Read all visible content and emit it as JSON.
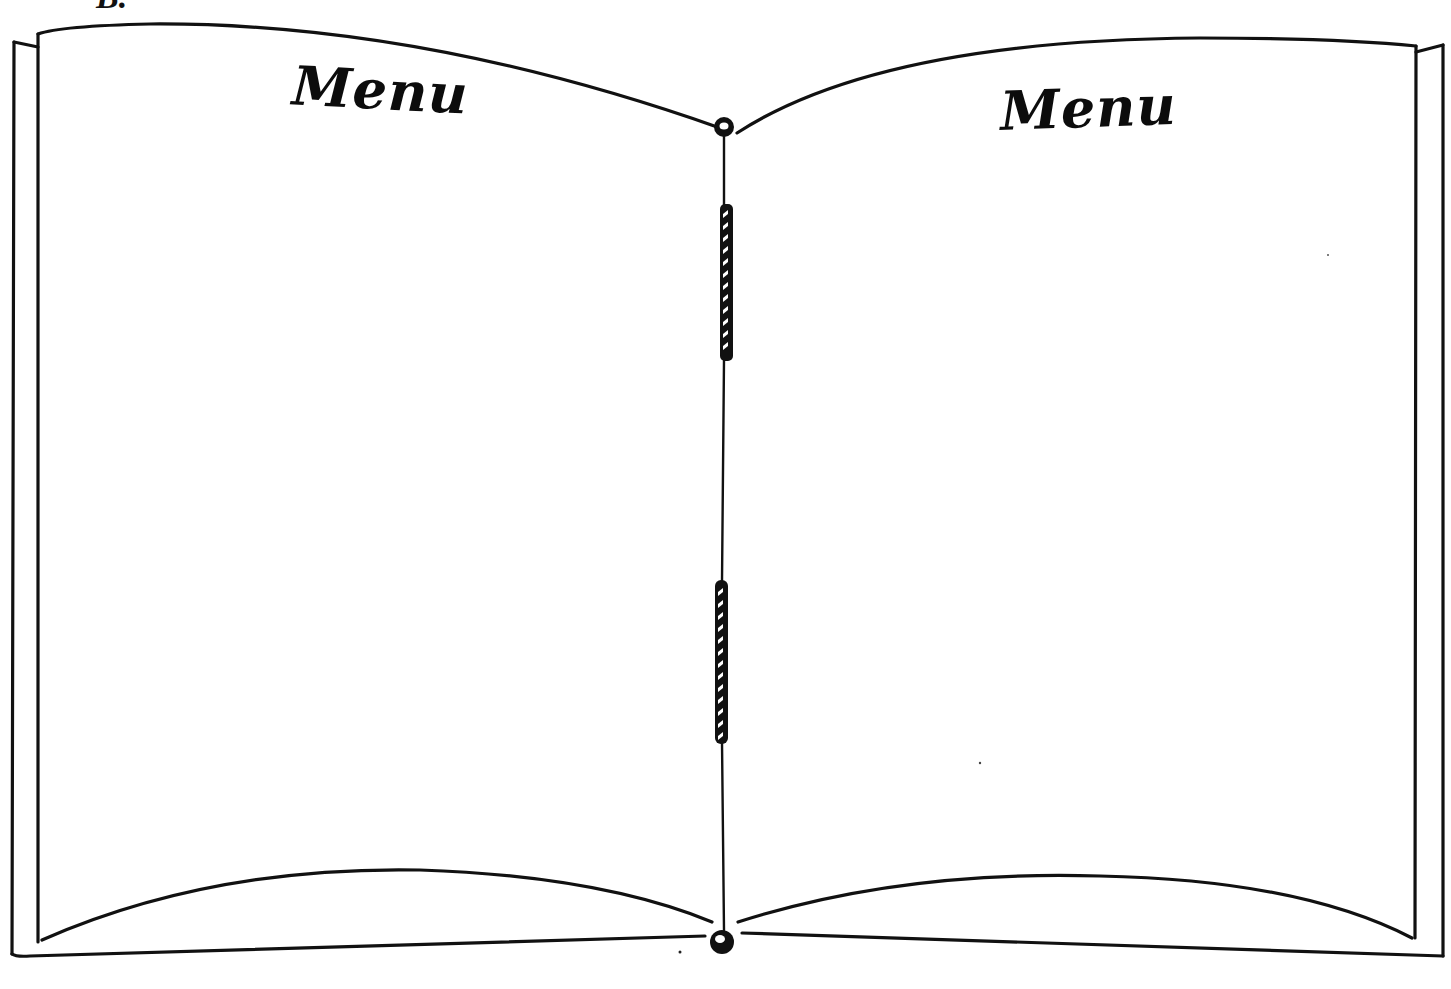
{
  "figure": {
    "label": "B.",
    "left_page": {
      "title": "Menu"
    },
    "right_page": {
      "title": "Menu"
    },
    "binding": {
      "cord_segments": 2,
      "end_knots": 2
    }
  },
  "colors": {
    "ink": "#111111",
    "paper": "#ffffff"
  }
}
